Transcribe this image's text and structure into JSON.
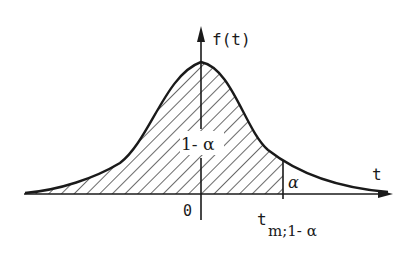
{
  "figure": {
    "type": "probability-density-diagram",
    "y_axis_label": "f(t)",
    "x_axis_label": "t",
    "origin_label": "0",
    "shaded_region_label": "1- α",
    "tail_region_label": "α",
    "critical_value_label": {
      "base": "t",
      "subscript": "m;1- α"
    },
    "colors": {
      "ink": "#1a1a1a",
      "background": "#ffffff"
    }
  }
}
